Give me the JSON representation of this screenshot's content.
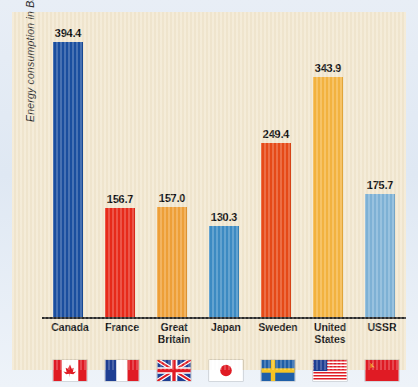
{
  "chart_data": {
    "type": "bar",
    "title": "",
    "xlabel": "",
    "ylabel": "Energy consumption in Btu",
    "ylim": [
      0,
      420
    ],
    "grid": false,
    "legend": "none",
    "categories": [
      "Canada",
      "France",
      "Great Britain",
      "Japan",
      "Sweden",
      "United States",
      "USSR"
    ],
    "values": [
      394.4,
      156.7,
      157.0,
      130.3,
      249.4,
      343.9,
      175.7
    ],
    "bar_colors": [
      "#1a4fa0",
      "#e92b1a",
      "#f0a139",
      "#3d8cc4",
      "#e84b18",
      "#f5b440",
      "#7fb3d7"
    ],
    "value_labels": [
      "394.4",
      "156.7",
      "157.0",
      "130.3",
      "249.4",
      "343.9",
      "175.7"
    ],
    "category_lines": [
      [
        "Canada"
      ],
      [
        "France"
      ],
      [
        "Great",
        "Britain"
      ],
      [
        "Japan"
      ],
      [
        "Sweden"
      ],
      [
        "United",
        "States"
      ],
      [
        "USSR"
      ]
    ],
    "flags": [
      "canada-flag-icon",
      "france-flag-icon",
      "great-britain-flag-icon",
      "japan-flag-icon",
      "sweden-flag-icon",
      "united-states-flag-icon",
      "ussr-flag-icon"
    ]
  },
  "panel": {
    "background_color": "#f2e7cf",
    "border_color": "#e3ebf5",
    "axis_color": "#2a2a2a"
  }
}
